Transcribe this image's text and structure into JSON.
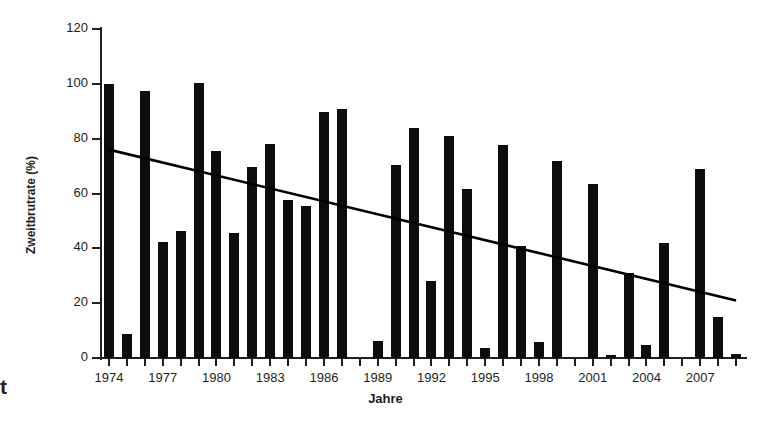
{
  "figure": {
    "cutoff_text": "t"
  },
  "chart_data": {
    "type": "bar",
    "title": "",
    "xlabel": "Jahre",
    "ylabel": "Zweitbrutrate (%)",
    "ylim": [
      0,
      120
    ],
    "ytick_labels": [
      "0",
      "20",
      "40",
      "60",
      "80",
      "100",
      "120"
    ],
    "yticks": [
      0,
      20,
      40,
      60,
      80,
      100,
      120
    ],
    "xtick_labels": [
      "1974",
      "1977",
      "1980",
      "1983",
      "1986",
      "1989",
      "1992",
      "1995",
      "1998",
      "2001",
      "2004",
      "2007"
    ],
    "xticks": [
      1974,
      1977,
      1980,
      1983,
      1986,
      1989,
      1992,
      1995,
      1998,
      2001,
      2004,
      2007
    ],
    "grid": false,
    "legend": "none",
    "categories": [
      1974,
      1975,
      1976,
      1977,
      1978,
      1979,
      1980,
      1981,
      1982,
      1983,
      1984,
      1985,
      1986,
      1987,
      1988,
      1989,
      1990,
      1991,
      1992,
      1993,
      1994,
      1995,
      1996,
      1997,
      1998,
      1999,
      2000,
      2001,
      2002,
      2003,
      2004,
      2005,
      2006,
      2007,
      2008,
      2009
    ],
    "values": [
      100,
      8.7,
      97.5,
      42.3,
      46.2,
      100.3,
      75.5,
      45.5,
      69.8,
      78,
      57.5,
      55.3,
      89.8,
      90.8,
      0,
      6.3,
      70.3,
      83.8,
      28.2,
      80.8,
      61.8,
      3.6,
      77.8,
      40.8,
      5.9,
      72,
      0,
      63.5,
      1.2,
      31,
      4.8,
      41.8,
      0,
      68.8,
      14.8,
      1.3
    ],
    "bar_color": "#0d0d0d",
    "trendline": {
      "type": "linear",
      "start": {
        "x": 1974,
        "y": 76.0
      },
      "end": {
        "x": 2009,
        "y": 21.0
      },
      "color": "#000000"
    }
  }
}
